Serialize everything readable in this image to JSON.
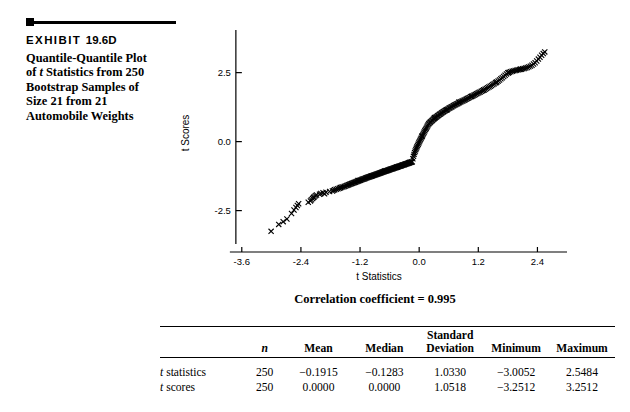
{
  "exhibit": {
    "label": "EXHIBIT",
    "number": "19.6D",
    "caption_line1": "Quantile-Quantile Plot",
    "caption_line2_pre": "of ",
    "caption_line2_italic": "t",
    "caption_line2_post": " Statistics from 250",
    "caption_line3": "Bootstrap Samples of",
    "caption_line4": "Size 21 from 21",
    "caption_line5": "Automobile Weights"
  },
  "chart_data": {
    "type": "scatter",
    "title": "",
    "xlabel": "t  Statistics",
    "ylabel": "t Scores",
    "xticks": [
      "-3.6",
      "-2.4",
      "-1.2",
      "0.0",
      "1.2",
      "2.4"
    ],
    "xtick_values": [
      -3.6,
      -2.4,
      -1.2,
      0.0,
      1.2,
      2.4
    ],
    "yticks": [
      "2.5",
      "0.0",
      "-2.5"
    ],
    "ytick_values": [
      2.5,
      0.0,
      -2.5
    ],
    "xlim": [
      -3.9,
      3.0
    ],
    "ylim": [
      -4.0,
      3.9
    ],
    "grid": false,
    "legend": null,
    "marker": "x",
    "annotation": "Correlation coefficient = 0.995",
    "correlation_coefficient": 0.995,
    "n_points": 250,
    "points": [
      [
        -3.0052,
        -3.2512
      ],
      [
        -2.6841,
        -2.8064
      ],
      [
        -2.5903,
        -2.6043
      ],
      [
        -2.5402,
        -2.4806
      ],
      [
        -2.501,
        -2.388
      ],
      [
        -2.472,
        -2.3133
      ],
      [
        -2.4465,
        -2.2505
      ],
      [
        -2.2509,
        -2.196
      ],
      [
        -2.2063,
        -2.1479
      ],
      [
        -2.1878,
        -2.1046
      ],
      [
        -2.1634,
        -2.0652
      ],
      [
        -2.1447,
        -2.029
      ],
      [
        -2.13,
        -1.9955
      ],
      [
        -2.1065,
        -1.9642
      ],
      [
        -2.0834,
        -1.9349
      ],
      [
        -2.0221,
        -1.9072
      ],
      [
        -1.996,
        -1.8811
      ],
      [
        -1.9512,
        -1.8562
      ],
      [
        -1.8903,
        -1.8325
      ],
      [
        -1.818,
        -1.8098
      ],
      [
        -1.7604,
        -1.788
      ],
      [
        -1.7362,
        -1.7671
      ],
      [
        -1.7145,
        -1.747
      ],
      [
        -1.6832,
        -1.7276
      ],
      [
        -1.6499,
        -1.7089
      ],
      [
        -1.621,
        -1.6908
      ],
      [
        -1.5947,
        -1.6732
      ],
      [
        -1.5702,
        -1.6562
      ],
      [
        -1.546,
        -1.6396
      ],
      [
        -1.5203,
        -1.6235
      ],
      [
        -1.4968,
        -1.6078
      ],
      [
        -1.471,
        -1.5925
      ],
      [
        -1.4502,
        -1.5776
      ],
      [
        -1.431,
        -1.563
      ],
      [
        -1.4112,
        -1.5487
      ],
      [
        -1.3905,
        -1.5348
      ],
      [
        -1.3716,
        -1.5211
      ],
      [
        -1.353,
        -1.5077
      ],
      [
        -1.3342,
        -1.4946
      ],
      [
        -1.316,
        -1.4817
      ],
      [
        -1.298,
        -1.4691
      ],
      [
        -1.2805,
        -1.4567
      ],
      [
        -1.263,
        -1.4445
      ],
      [
        -1.246,
        -1.4325
      ],
      [
        -1.229,
        -1.4207
      ],
      [
        -1.212,
        -1.4091
      ],
      [
        -1.1955,
        -1.3977
      ],
      [
        -1.179,
        -1.3864
      ],
      [
        -1.1628,
        -1.3753
      ],
      [
        -1.1466,
        -1.3644
      ],
      [
        -1.1306,
        -1.3536
      ],
      [
        -1.1148,
        -1.3429
      ],
      [
        -1.099,
        -1.3324
      ],
      [
        -1.0834,
        -1.322
      ],
      [
        -1.068,
        -1.3117
      ],
      [
        -1.0526,
        -1.3016
      ],
      [
        -1.0374,
        -1.2915
      ],
      [
        -1.0222,
        -1.2816
      ],
      [
        -1.0072,
        -1.2718
      ],
      [
        -0.9922,
        -1.2621
      ],
      [
        -0.9774,
        -1.2524
      ],
      [
        -0.9626,
        -1.2429
      ],
      [
        -0.948,
        -1.2335
      ],
      [
        -0.9334,
        -1.2241
      ],
      [
        -0.9189,
        -1.2149
      ],
      [
        -0.9045,
        -1.2057
      ],
      [
        -0.8902,
        -1.1966
      ],
      [
        -0.876,
        -1.1876
      ],
      [
        -0.8618,
        -1.1786
      ],
      [
        -0.8478,
        -1.1697
      ],
      [
        -0.8338,
        -1.1609
      ],
      [
        -0.8199,
        -1.1522
      ],
      [
        -0.806,
        -1.1435
      ],
      [
        -0.7923,
        -1.1349
      ],
      [
        -0.7786,
        -1.1263
      ],
      [
        -0.765,
        -1.1178
      ],
      [
        -0.7514,
        -1.1094
      ],
      [
        -0.7379,
        -1.101
      ],
      [
        -0.7245,
        -1.0926
      ],
      [
        -0.7112,
        -1.0843
      ],
      [
        -0.6979,
        -1.0761
      ],
      [
        -0.6846,
        -1.0679
      ],
      [
        -0.6715,
        -1.0597
      ],
      [
        -0.6584,
        -1.0516
      ],
      [
        -0.6453,
        -1.0435
      ],
      [
        -0.6323,
        -1.0355
      ],
      [
        -0.6194,
        -1.0275
      ],
      [
        -0.6065,
        -1.0195
      ],
      [
        -0.5936,
        -1.0116
      ],
      [
        -0.5808,
        -1.0037
      ],
      [
        -0.5681,
        -0.9958
      ],
      [
        -0.5554,
        -0.988
      ],
      [
        -0.5427,
        -0.9802
      ],
      [
        -0.5301,
        -0.9724
      ],
      [
        -0.5175,
        -0.9646
      ],
      [
        -0.505,
        -0.9569
      ],
      [
        -0.4925,
        -0.9492
      ],
      [
        -0.48,
        -0.9415
      ],
      [
        -0.4676,
        -0.9338
      ],
      [
        -0.4552,
        -0.9262
      ],
      [
        -0.4428,
        -0.9185
      ],
      [
        -0.4305,
        -0.9109
      ],
      [
        -0.4182,
        -0.9033
      ],
      [
        -0.4059,
        -0.8957
      ],
      [
        -0.3936,
        -0.8881
      ],
      [
        -0.3814,
        -0.8805
      ],
      [
        -0.3692,
        -0.873
      ],
      [
        -0.357,
        -0.8654
      ],
      [
        -0.3448,
        -0.8578
      ],
      [
        -0.3327,
        -0.8503
      ],
      [
        -0.3206,
        -0.8427
      ],
      [
        -0.3085,
        -0.8352
      ],
      [
        -0.2964,
        -0.8276
      ],
      [
        -0.2843,
        -0.8201
      ],
      [
        -0.2722,
        -0.8125
      ],
      [
        -0.2602,
        -0.805
      ],
      [
        -0.2481,
        -0.7974
      ],
      [
        -0.2361,
        -0.7898
      ],
      [
        -0.2241,
        -0.7823
      ],
      [
        -0.2121,
        -0.7747
      ],
      [
        -0.2001,
        -0.7671
      ],
      [
        -0.1881,
        -0.7595
      ],
      [
        -0.1761,
        -0.7519
      ],
      [
        -0.1641,
        -0.7443
      ],
      [
        -0.1521,
        -0.7367
      ],
      [
        -0.1401,
        -0.729
      ],
      [
        -0.1283,
        -0.618
      ],
      [
        -0.116,
        -0.534
      ],
      [
        -0.104,
        -0.462
      ],
      [
        -0.092,
        -0.398
      ],
      [
        -0.08,
        -0.34
      ],
      [
        -0.068,
        -0.286
      ],
      [
        -0.056,
        -0.235
      ],
      [
        -0.044,
        -0.187
      ],
      [
        -0.032,
        -0.14
      ],
      [
        -0.02,
        -0.094
      ],
      [
        -0.008,
        -0.049
      ],
      [
        0.004,
        -0.005
      ],
      [
        0.016,
        0.039
      ],
      [
        0.028,
        0.083
      ],
      [
        0.04,
        0.127
      ],
      [
        0.052,
        0.171
      ],
      [
        0.0645,
        0.215
      ],
      [
        0.077,
        0.259
      ],
      [
        0.0895,
        0.303
      ],
      [
        0.102,
        0.347
      ],
      [
        0.115,
        0.391
      ],
      [
        0.128,
        0.435
      ],
      [
        0.141,
        0.479
      ],
      [
        0.1545,
        0.523
      ],
      [
        0.168,
        0.567
      ],
      [
        0.1818,
        0.611
      ],
      [
        0.1958,
        0.646
      ],
      [
        0.2098,
        0.673
      ],
      [
        0.224,
        0.699
      ],
      [
        0.2384,
        0.725
      ],
      [
        0.253,
        0.75
      ],
      [
        0.2678,
        0.775
      ],
      [
        0.2828,
        0.799
      ],
      [
        0.298,
        0.823
      ],
      [
        0.3134,
        0.846
      ],
      [
        0.329,
        0.869
      ],
      [
        0.3448,
        0.892
      ],
      [
        0.3608,
        0.914
      ],
      [
        0.377,
        0.936
      ],
      [
        0.3934,
        0.958
      ],
      [
        0.41,
        0.98
      ],
      [
        0.4268,
        1.002
      ],
      [
        0.4438,
        1.023
      ],
      [
        0.461,
        1.044
      ],
      [
        0.4784,
        1.065
      ],
      [
        0.496,
        1.086
      ],
      [
        0.5138,
        1.107
      ],
      [
        0.5318,
        1.127
      ],
      [
        0.55,
        1.147
      ],
      [
        0.5684,
        1.167
      ],
      [
        0.587,
        1.187
      ],
      [
        0.6058,
        1.207
      ],
      [
        0.6248,
        1.227
      ],
      [
        0.644,
        1.247
      ],
      [
        0.6634,
        1.266
      ],
      [
        0.683,
        1.286
      ],
      [
        0.7028,
        1.305
      ],
      [
        0.7228,
        1.325
      ],
      [
        0.743,
        1.344
      ],
      [
        0.7634,
        1.364
      ],
      [
        0.784,
        1.383
      ],
      [
        0.8048,
        1.403
      ],
      [
        0.8258,
        1.422
      ],
      [
        0.847,
        1.442
      ],
      [
        0.8684,
        1.462
      ],
      [
        0.89,
        1.481
      ],
      [
        0.9118,
        1.501
      ],
      [
        0.9338,
        1.521
      ],
      [
        0.956,
        1.541
      ],
      [
        0.9784,
        1.562
      ],
      [
        1.001,
        1.582
      ],
      [
        1.0238,
        1.603
      ],
      [
        1.0468,
        1.624
      ],
      [
        1.07,
        1.645
      ],
      [
        1.0934,
        1.666
      ],
      [
        1.117,
        1.687
      ],
      [
        1.1408,
        1.709
      ],
      [
        1.1648,
        1.731
      ],
      [
        1.189,
        1.753
      ],
      [
        1.2134,
        1.776
      ],
      [
        1.238,
        1.799
      ],
      [
        1.2628,
        1.823
      ],
      [
        1.2878,
        1.847
      ],
      [
        1.313,
        1.872
      ],
      [
        1.3384,
        1.897
      ],
      [
        1.364,
        1.923
      ],
      [
        1.3898,
        1.95
      ],
      [
        1.4158,
        1.978
      ],
      [
        1.442,
        2.006
      ],
      [
        1.4684,
        2.035
      ],
      [
        1.495,
        2.066
      ],
      [
        1.5218,
        2.097
      ],
      [
        1.5488,
        2.13
      ],
      [
        1.576,
        2.164
      ],
      [
        1.6034,
        2.199
      ],
      [
        1.631,
        2.236
      ],
      [
        1.6588,
        2.275
      ],
      [
        1.6868,
        2.316
      ],
      [
        1.715,
        2.359
      ],
      [
        1.7434,
        2.405
      ],
      [
        1.772,
        2.454
      ],
      [
        1.8008,
        2.494
      ],
      [
        1.8298,
        2.516
      ],
      [
        1.859,
        2.534
      ],
      [
        1.8884,
        2.55
      ],
      [
        1.918,
        2.564
      ],
      [
        1.9478,
        2.577
      ],
      [
        1.9778,
        2.589
      ],
      [
        2.008,
        2.601
      ],
      [
        2.0384,
        2.613
      ],
      [
        2.069,
        2.625
      ],
      [
        2.0998,
        2.638
      ],
      [
        2.1308,
        2.652
      ],
      [
        2.162,
        2.668
      ],
      [
        2.1934,
        2.687
      ],
      [
        2.225,
        2.709
      ],
      [
        2.2568,
        2.736
      ],
      [
        2.2888,
        2.769
      ],
      [
        2.321,
        2.81
      ],
      [
        2.3534,
        2.86
      ],
      [
        2.386,
        2.92
      ],
      [
        2.4188,
        2.99
      ],
      [
        2.4518,
        3.06
      ],
      [
        2.485,
        3.13
      ],
      [
        2.5184,
        3.19
      ],
      [
        2.5484,
        3.2512
      ],
      [
        -2.85,
        -3.0
      ],
      [
        -2.76,
        -2.9
      ],
      [
        -1.92,
        -1.89
      ],
      [
        -1.6,
        -1.66
      ],
      [
        -1.24,
        -1.41
      ],
      [
        -0.97,
        -1.25
      ],
      [
        -0.7,
        -1.07
      ],
      [
        -0.45,
        -0.92
      ],
      [
        -0.2,
        -0.76
      ],
      [
        0.06,
        0.2
      ],
      [
        0.31,
        0.87
      ],
      [
        0.56,
        1.15
      ],
      [
        0.81,
        1.44
      ],
      [
        1.06,
        1.64
      ],
      [
        1.31,
        1.87
      ],
      [
        1.56,
        2.14
      ],
      [
        1.81,
        2.49
      ],
      [
        2.06,
        2.62
      ]
    ]
  },
  "table": {
    "headers": [
      "",
      "n",
      "Mean",
      "Median",
      "Standard Deviation",
      "Minimum",
      "Maximum"
    ],
    "header_n": "n",
    "header_mean": "Mean",
    "header_median": "Median",
    "header_sd_line1": "Standard",
    "header_sd_line2": "Deviation",
    "header_min": "Minimum",
    "header_max": "Maximum",
    "rows": [
      {
        "label_italic": "t",
        "label_rest": " statistics",
        "n": "250",
        "mean": "−0.1915",
        "median": "−0.1283",
        "sd": "1.0330",
        "min": "−3.0052",
        "max": "2.5484"
      },
      {
        "label_italic": "t",
        "label_rest": " scores",
        "n": "250",
        "mean": "0.0000",
        "median": "0.0000",
        "sd": "1.0518",
        "min": "−3.2512",
        "max": "3.2512"
      }
    ]
  }
}
